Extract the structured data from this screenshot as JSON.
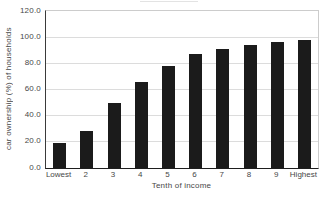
{
  "chart_data": {
    "type": "bar",
    "title": "",
    "categories": [
      "Lowest",
      "2",
      "3",
      "4",
      "5",
      "6",
      "7",
      "8",
      "9",
      "Highest"
    ],
    "values": [
      19,
      28,
      50,
      66,
      78,
      87,
      91,
      94,
      96,
      98
    ],
    "xlabel": "Tenth of income",
    "ylabel": "car ownership (%) of households",
    "ylim": [
      0,
      120
    ],
    "ytick_values": [
      0,
      20,
      40,
      60,
      80,
      100,
      120
    ],
    "ytick_labels": [
      "0.0",
      "20.0",
      "40.0",
      "60.0",
      "80.0",
      "100.0",
      "120.0"
    ],
    "grid": true,
    "legend": "none",
    "bar_color": "#1b1b1b",
    "gridline_color": "#dcdcdc",
    "axis_dark_color": "#2b2b2b",
    "axis_light_color": "#cccccc",
    "text_color": "#474747",
    "bar_width_px": 13
  }
}
